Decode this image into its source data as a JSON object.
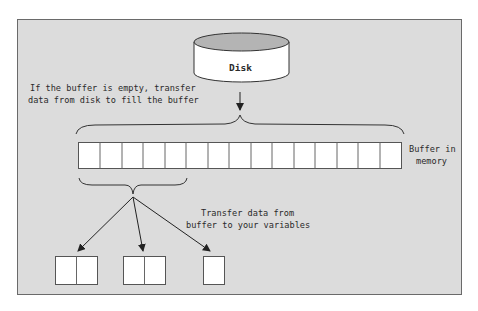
{
  "diagram": {
    "disk": {
      "label": "Disk"
    },
    "buffer": {
      "label_line1": "Buffer in",
      "label_line2": "memory",
      "cell_count": 15
    },
    "fill_note": {
      "line1": "If the buffer is empty, transfer",
      "line2": "data from disk to fill the buffer"
    },
    "transfer_note": {
      "line1": "Transfer data from",
      "line2": "buffer to your variables"
    },
    "variables": [
      {
        "name": "variable-1",
        "cells": 2
      },
      {
        "name": "variable-2",
        "cells": 2
      },
      {
        "name": "variable-3",
        "cells": 1
      }
    ],
    "colors": {
      "background": "#dcdcdc",
      "frame_border": "#6a6a6a",
      "cell_fill": "#ffffff",
      "cell_stroke": "#555555",
      "disk_top": "#b4b4b4",
      "line": "#222222"
    }
  }
}
